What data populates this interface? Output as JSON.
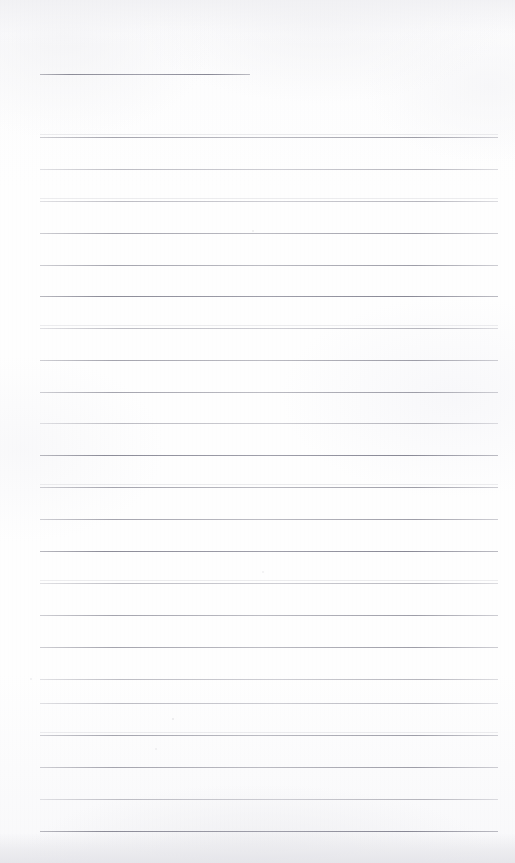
{
  "document": {
    "kind": "scanned-blank-ruled-page",
    "title": "Blank Ruled Notebook Page",
    "text_content": "",
    "handwriting_present": false,
    "page_width": 515,
    "page_height": 863
  },
  "paper": {
    "background_color": "#fdfdfd",
    "tint_color": "#f7f7f9",
    "bottom_band_color": "#e8e8ec",
    "top_band_color": "#f0f0f3"
  },
  "ruling": {
    "line_color": "#b9b9bf",
    "line_color_dark": "#8c8c95",
    "line_thickness": 1,
    "left_margin_x": 40,
    "right_margin_x": 498,
    "first_line_right_x": 250,
    "line_spacing": 31.6,
    "line_count": 24,
    "lines": [
      {
        "y": 74,
        "x1": 40,
        "x2": 250,
        "ink": "ink-dark",
        "ghost": false
      },
      {
        "y": 137,
        "x1": 40,
        "x2": 498,
        "ink": "ink-medium",
        "ghost": true
      },
      {
        "y": 169,
        "x1": 40,
        "x2": 498,
        "ink": "ink-light",
        "ghost": false
      },
      {
        "y": 201,
        "x1": 40,
        "x2": 498,
        "ink": "ink-light",
        "ghost": true
      },
      {
        "y": 233,
        "x1": 40,
        "x2": 498,
        "ink": "ink-medium",
        "ghost": false
      },
      {
        "y": 265,
        "x1": 40,
        "x2": 498,
        "ink": "ink-medium",
        "ghost": false
      },
      {
        "y": 296,
        "x1": 40,
        "x2": 498,
        "ink": "ink-dark",
        "ghost": false
      },
      {
        "y": 328,
        "x1": 40,
        "x2": 498,
        "ink": "ink-light",
        "ghost": true
      },
      {
        "y": 360,
        "x1": 40,
        "x2": 498,
        "ink": "ink-medium",
        "ghost": false
      },
      {
        "y": 392,
        "x1": 40,
        "x2": 498,
        "ink": "ink-medium",
        "ghost": false
      },
      {
        "y": 423,
        "x1": 40,
        "x2": 498,
        "ink": "ink-light",
        "ghost": false
      },
      {
        "y": 455,
        "x1": 40,
        "x2": 498,
        "ink": "ink-dark",
        "ghost": false
      },
      {
        "y": 487,
        "x1": 40,
        "x2": 498,
        "ink": "ink-medium",
        "ghost": true
      },
      {
        "y": 519,
        "x1": 40,
        "x2": 498,
        "ink": "ink-medium",
        "ghost": false
      },
      {
        "y": 551,
        "x1": 40,
        "x2": 498,
        "ink": "ink-dark",
        "ghost": false
      },
      {
        "y": 583,
        "x1": 40,
        "x2": 498,
        "ink": "ink-light",
        "ghost": true
      },
      {
        "y": 615,
        "x1": 40,
        "x2": 498,
        "ink": "ink-medium",
        "ghost": false
      },
      {
        "y": 647,
        "x1": 40,
        "x2": 498,
        "ink": "ink-medium",
        "ghost": false
      },
      {
        "y": 679,
        "x1": 40,
        "x2": 498,
        "ink": "ink-light",
        "ghost": false
      },
      {
        "y": 703,
        "x1": 40,
        "x2": 498,
        "ink": "ink-light",
        "ghost": false
      },
      {
        "y": 735,
        "x1": 40,
        "x2": 498,
        "ink": "ink-medium",
        "ghost": true
      },
      {
        "y": 767,
        "x1": 40,
        "x2": 498,
        "ink": "ink-medium",
        "ghost": false
      },
      {
        "y": 799,
        "x1": 40,
        "x2": 498,
        "ink": "ink-light",
        "ghost": false
      },
      {
        "y": 831,
        "x1": 40,
        "x2": 498,
        "ink": "ink-dark",
        "ghost": false
      }
    ]
  },
  "marks": [
    {
      "name": "faint-speck-upper-mid",
      "x": 252,
      "y": 230,
      "size": 2,
      "opacity": 0.18
    },
    {
      "name": "faint-speck-left",
      "x": 30,
      "y": 678,
      "size": 2,
      "opacity": 0.16
    },
    {
      "name": "faint-speck-mid",
      "x": 262,
      "y": 571,
      "size": 2,
      "opacity": 0.15
    },
    {
      "name": "faint-speck-lower",
      "x": 172,
      "y": 718,
      "size": 2,
      "opacity": 0.2
    },
    {
      "name": "faint-speck-lower-mid",
      "x": 155,
      "y": 748,
      "size": 2,
      "opacity": 0.14
    }
  ]
}
